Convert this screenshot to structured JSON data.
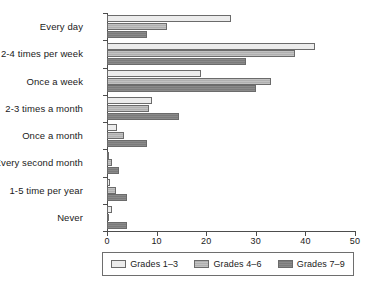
{
  "chart_data": {
    "type": "bar",
    "orientation": "horizontal",
    "title": "",
    "xlabel": "",
    "ylabel": "",
    "xlim": [
      0,
      50
    ],
    "xticks": [
      0,
      10,
      20,
      30,
      40,
      50
    ],
    "grid": false,
    "legend_position": "bottom",
    "categories": [
      "Every day",
      "2-4 times per week",
      "Once a week",
      "2-3 times a month",
      "Once a month",
      "Every second month",
      "1-5 time per year",
      "Never"
    ],
    "series": [
      {
        "name": "Grades 1–3",
        "color": "#ececec",
        "values": [
          25,
          42,
          19,
          9,
          2,
          0.4,
          0.7,
          1
        ]
      },
      {
        "name": "Grades 4–6",
        "color": "#b8b8b8",
        "values": [
          12,
          38,
          33,
          8.5,
          3.5,
          1,
          1.8,
          0.3
        ]
      },
      {
        "name": "Grades 7–9",
        "color": "#808080",
        "values": [
          8,
          28,
          30,
          14.5,
          8,
          2.5,
          4,
          4
        ]
      }
    ]
  },
  "legend": {
    "items": [
      {
        "label": "Grades 1–3"
      },
      {
        "label": "Grades 4–6"
      },
      {
        "label": "Grades 7–9"
      }
    ]
  }
}
